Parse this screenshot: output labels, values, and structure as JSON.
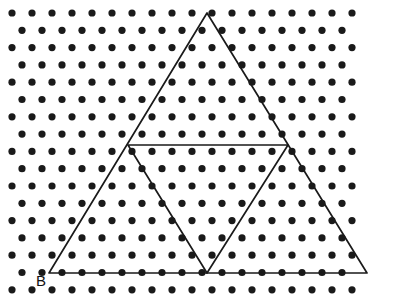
{
  "figure": {
    "type": "geometry-diagram",
    "background_color": "#ffffff",
    "dot_color": "#1a1a1a",
    "line_color": "#1a1a1a",
    "label_color": "#111111",
    "canvas": {
      "width": 406,
      "height": 302
    }
  },
  "lattice": {
    "kind": "triangular",
    "rows": 17,
    "dots_even_row": 18,
    "dots_odd_row": 17,
    "x_start_even": 12,
    "x_start_odd": 22,
    "x_spacing": 20,
    "y_start": 13,
    "y_spacing": 17.3,
    "dot_radius": 3.6
  },
  "outer_triangle": {
    "name": "large equilateral triangle",
    "vertices": [
      {
        "id": "apex",
        "x": 207,
        "y": 13,
        "label": ""
      },
      {
        "id": "bottom-left",
        "x": 49,
        "y": 273,
        "label": "B"
      },
      {
        "id": "bottom-right",
        "x": 367,
        "y": 273,
        "label": ""
      }
    ]
  },
  "inner_triangle": {
    "name": "medial inverted triangle",
    "vertices": [
      {
        "id": "mid-left",
        "x": 128,
        "y": 145,
        "label": ""
      },
      {
        "id": "mid-right",
        "x": 288,
        "y": 145,
        "label": ""
      },
      {
        "id": "mid-bottom",
        "x": 207,
        "y": 273,
        "label": ""
      }
    ]
  },
  "labels": [
    {
      "id": "label-b",
      "text": "B",
      "x": 36,
      "y": 286
    }
  ]
}
